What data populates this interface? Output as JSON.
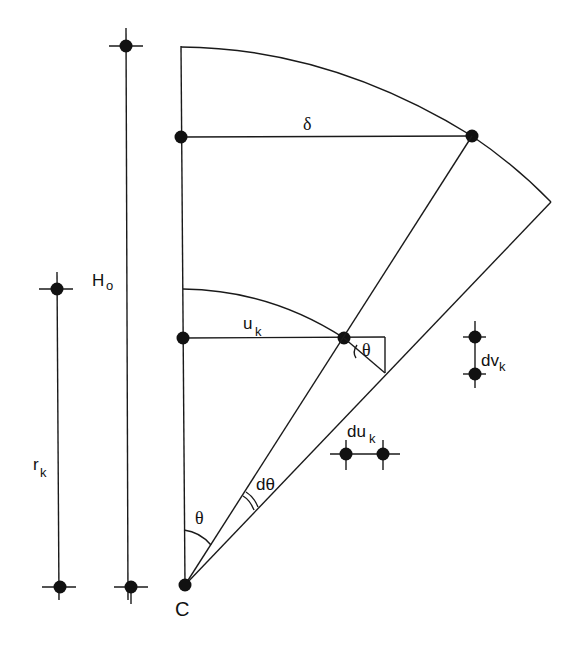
{
  "diagram": {
    "type": "geometric-deformation-sketch",
    "labels": {
      "height": "H",
      "height_sub": "o",
      "radius": "r",
      "radius_sub": "k",
      "displacement_top": "δ",
      "displacement_u": "u",
      "displacement_u_sub": "k",
      "angle_theta_base": "θ",
      "angle_dtheta": "dθ",
      "angle_theta_small": "θ",
      "du": "du",
      "du_sub": "k",
      "dv": "dv",
      "dv_sub": "k",
      "center": "C"
    }
  }
}
